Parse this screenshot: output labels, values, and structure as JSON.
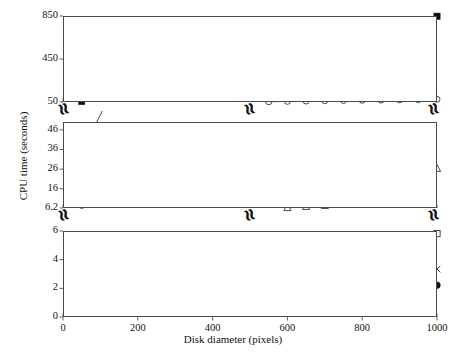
{
  "figure": {
    "caption_axis_y": "CPU time (seconds)",
    "caption_axis_x": "Disk diameter (pixels)",
    "break_symbol": "≈"
  },
  "chart_data": {
    "type": "line",
    "title": "",
    "xlabel": "Disk diameter (pixels)",
    "ylabel": "CPU time (seconds)",
    "grid": true,
    "legend_position": "none",
    "broken_axis": true,
    "x": [
      50,
      100,
      150,
      200,
      250,
      300,
      350,
      400,
      450,
      500,
      550,
      600,
      650,
      700,
      750,
      800,
      850,
      900,
      950,
      1000
    ],
    "panels": [
      {
        "name": "top-panel",
        "ylim": [
          50,
          850
        ],
        "yticks": [
          50,
          450,
          850
        ],
        "ytick_labels": [
          "50",
          "450",
          "850"
        ],
        "series": [
          {
            "name": "filled-square-series",
            "marker": "filled-square",
            "x": [
              50,
              100,
              150,
              200,
              250,
              300,
              350,
              400,
              450,
              500,
              550,
              600,
              650,
              700,
              750,
              800,
              850,
              900,
              950,
              1000
            ],
            "values": [
              55,
              88,
              118,
              150,
              183,
              214,
              248,
              281,
              312,
              345,
              378,
              411,
              440,
              470,
              516,
              557,
              608,
              661,
              730,
              848
            ]
          },
          {
            "name": "open-circle-series",
            "marker": "open-circle",
            "x": [
              550,
              600,
              650,
              700,
              750,
              800,
              850,
              900,
              950,
              1000
            ],
            "values": [
              52,
              56,
              59,
              62,
              64,
              66,
              68,
              70,
              72,
              75
            ]
          }
        ]
      },
      {
        "name": "middle-panel",
        "ylim": [
          6.2,
          50
        ],
        "yticks": [
          6.2,
          16,
          26,
          36,
          46
        ],
        "ytick_labels": [
          "6.2",
          "16",
          "26",
          "36",
          "46"
        ],
        "series": [
          {
            "name": "open-circle-series",
            "marker": "open-circle",
            "x": [
              50,
              100,
              150,
              200,
              250,
              300,
              350,
              400
            ],
            "values": [
              7.5,
              15.6,
              22.0,
              29.2,
              35.6,
              35.9,
              41.6,
              46.7
            ]
          },
          {
            "name": "annotated-square-point",
            "marker": "filled-square",
            "x": [
              60
            ],
            "values": [
              38.5
            ],
            "annotation": "leader-line"
          },
          {
            "name": "open-triangle-series",
            "marker": "open-triangle",
            "x": [
              600,
              650,
              700,
              750,
              800,
              850,
              900,
              950,
              1000
            ],
            "values": [
              6.3,
              6.9,
              7.4,
              8.5,
              9.6,
              11.9,
              15.5,
              20.3,
              26.3
            ]
          }
        ]
      },
      {
        "name": "bottom-panel",
        "ylim": [
          0,
          6
        ],
        "yticks": [
          0,
          2,
          4,
          6
        ],
        "ytick_labels": [
          "0",
          "2",
          "4",
          "6"
        ],
        "series": [
          {
            "name": "open-triangle-series",
            "marker": "open-triangle",
            "x": [
              50,
              100,
              150,
              200,
              250,
              300,
              350,
              400,
              450,
              500,
              550
            ],
            "values": [
              2.68,
              2.72,
              2.8,
              2.92,
              2.95,
              3.18,
              3.62,
              4.18,
              4.62,
              5.12,
              5.53
            ]
          },
          {
            "name": "open-square-series",
            "marker": "open-square",
            "x": [
              50,
              100,
              150,
              200,
              250,
              300,
              350,
              400,
              450,
              500,
              550,
              600,
              650,
              700,
              750,
              800,
              850,
              900,
              950,
              1000
            ],
            "values": [
              2.64,
              2.68,
              2.7,
              2.72,
              2.72,
              2.78,
              2.84,
              2.92,
              2.98,
              3.02,
              3.06,
              3.14,
              3.26,
              3.52,
              3.82,
              4.08,
              4.38,
              4.76,
              5.28,
              5.82
            ]
          },
          {
            "name": "x-cross-series",
            "marker": "x-cross",
            "x": [
              50,
              100,
              150,
              200,
              250,
              300,
              350,
              400,
              450,
              500,
              550,
              600,
              650,
              700,
              750,
              800,
              850,
              900,
              950,
              1000
            ],
            "values": [
              2.62,
              2.66,
              2.68,
              2.7,
              2.7,
              2.74,
              2.78,
              2.82,
              2.86,
              2.88,
              2.9,
              2.92,
              2.94,
              2.96,
              2.98,
              3.0,
              3.04,
              3.1,
              3.2,
              3.34
            ]
          },
          {
            "name": "filled-circle-series",
            "marker": "filled-circle",
            "x": [
              50,
              100,
              150,
              200,
              250,
              300,
              350,
              400,
              450,
              500,
              550,
              600,
              650,
              700,
              750,
              800,
              850,
              900,
              950,
              1000
            ],
            "values": [
              0.95,
              0.98,
              1.02,
              1.04,
              1.06,
              1.1,
              1.14,
              1.2,
              1.26,
              1.3,
              1.38,
              1.48,
              1.56,
              1.64,
              1.76,
              1.86,
              1.96,
              2.1,
              2.2,
              2.22
            ]
          }
        ]
      }
    ],
    "xticks": [
      0,
      200,
      400,
      600,
      800,
      1000
    ],
    "xtick_labels": [
      "0",
      "200",
      "400",
      "600",
      "800",
      "1000"
    ]
  }
}
